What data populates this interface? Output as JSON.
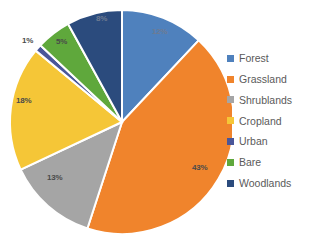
{
  "chart_data": {
    "type": "pie",
    "title": "",
    "categories": [
      "Forest",
      "Grassland",
      "Shrublands",
      "Cropland",
      "Urban",
      "Bare",
      "Woodlands"
    ],
    "values": [
      12,
      43,
      13,
      18,
      1,
      5,
      8
    ],
    "value_labels": [
      "12%",
      "43%",
      "13%",
      "18%",
      "1%",
      "5%",
      "8%"
    ],
    "colors": [
      "#4f81bd",
      "#f0842c",
      "#a5a5a5",
      "#f5c637",
      "#4a5699",
      "#5fa83c",
      "#2b4b7d"
    ],
    "label_positions": [
      {
        "left": 152,
        "top": 27
      },
      {
        "left": 192,
        "top": 163
      },
      {
        "left": 47,
        "top": 173
      },
      {
        "left": 16,
        "top": 96
      },
      {
        "left": 22,
        "top": 36
      },
      {
        "left": 56,
        "top": 37
      },
      {
        "left": 96,
        "top": 14
      }
    ],
    "label_on_dark": [
      true,
      false,
      false,
      false,
      false,
      false,
      true
    ],
    "start_angle_deg": 0,
    "direction": "clockwise",
    "legend_position": "right",
    "grid": false,
    "units": "percent",
    "slice_gap_color": "#ffffff"
  },
  "legend": {
    "items": [
      {
        "label": "Forest",
        "color": "#4f81bd"
      },
      {
        "label": "Grassland",
        "color": "#f0842c"
      },
      {
        "label": "Shrublands",
        "color": "#a5a5a5"
      },
      {
        "label": "Cropland",
        "color": "#f5c637"
      },
      {
        "label": "Urban",
        "color": "#4a5699"
      },
      {
        "label": "Bare",
        "color": "#5fa83c"
      },
      {
        "label": "Woodlands",
        "color": "#2b4b7d"
      }
    ]
  }
}
